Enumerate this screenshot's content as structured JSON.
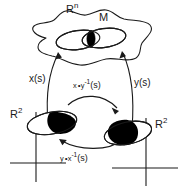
{
  "figure": {
    "stroke_color": "#1a1a1a",
    "fill_color": "#000000",
    "background": "#ffffff"
  },
  "labels": {
    "ambient_space": "R",
    "ambient_space_sup": "n",
    "manifold": "M",
    "chart_x": "x(s)",
    "chart_y": "y(s)",
    "transition_xy": "x∘y",
    "transition_xy_sup": "-1",
    "transition_xy_arg": "(s)",
    "transition_yx": "y∘x",
    "transition_yx_sup": "-1",
    "transition_yx_arg": "(s)",
    "domain_left": "R",
    "domain_left_sup": "2",
    "domain_right": "R",
    "domain_right_sup": "2"
  },
  "elements": {
    "manifold_blob": "irregular-closed-curve",
    "chart_patch_left": "ellipse-open-left",
    "chart_patch_right": "ellipse-open-right",
    "overlap_region": "black-lens-intersection",
    "arrow_x": "arrow-up-right-to-manifold",
    "arrow_y": "arrow-up-left-to-manifold",
    "arrow_transition_top": "curved-arrow-left-to-right",
    "arrow_transition_bottom": "curved-arrow-right-to-left",
    "axes_left": "cartesian-axes",
    "axes_right": "cartesian-axes",
    "plane_ellipse_left": "ellipse-black-right-half",
    "plane_ellipse_right": "ellipse-black-left-wedge"
  }
}
